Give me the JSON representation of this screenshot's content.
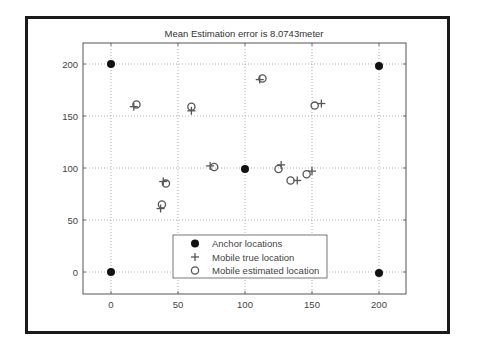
{
  "chart_data": {
    "type": "scatter",
    "title": "Mean Estimation error is 8.0743meter",
    "xlabel": "",
    "ylabel": "",
    "xlim": [
      -20,
      220
    ],
    "ylim": [
      -20,
      220
    ],
    "xticks": [
      0,
      50,
      100,
      150,
      200
    ],
    "yticks": [
      0,
      50,
      100,
      150,
      200
    ],
    "grid": true,
    "legend_position": "lower center",
    "series": [
      {
        "name": "Anchor locations",
        "marker": "filled-circle",
        "points": [
          [
            0,
            200
          ],
          [
            200,
            198
          ],
          [
            100,
            99
          ],
          [
            0,
            0
          ],
          [
            200,
            -1
          ]
        ]
      },
      {
        "name": "Mobile true location",
        "marker": "plus",
        "points": [
          [
            17,
            159
          ],
          [
            60,
            155
          ],
          [
            111,
            185
          ],
          [
            157,
            162
          ],
          [
            74,
            102
          ],
          [
            127,
            103
          ],
          [
            139,
            88
          ],
          [
            150,
            97
          ],
          [
            39,
            87
          ],
          [
            37,
            61
          ]
        ]
      },
      {
        "name": "Mobile estimated location",
        "marker": "open-circle",
        "points": [
          [
            19,
            161
          ],
          [
            60,
            159
          ],
          [
            113,
            186
          ],
          [
            152,
            160
          ],
          [
            77,
            101
          ],
          [
            125,
            99
          ],
          [
            134,
            88
          ],
          [
            146,
            94
          ],
          [
            41,
            85
          ],
          [
            38,
            65
          ]
        ]
      }
    ]
  },
  "colors": {
    "frame": "#1a1a1a",
    "axes": "#555555",
    "grid": "#999999",
    "anchor": "#111111",
    "mobile": "#555555"
  }
}
